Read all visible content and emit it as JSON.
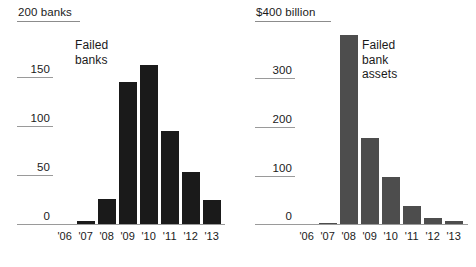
{
  "chart_data": [
    {
      "id": "failed-banks",
      "type": "bar",
      "title": "Failed banks",
      "axis_caption": "200 banks",
      "xlabel": "",
      "ylabel": "banks",
      "ylim": [
        0,
        200
      ],
      "grid": true,
      "legend": "none",
      "categories": [
        "'06",
        "'07",
        "'08",
        "'09",
        "'10",
        "'11",
        "'12",
        "'13"
      ],
      "values": [
        0,
        3,
        25,
        140,
        157,
        92,
        51,
        24
      ],
      "yticks": [
        0,
        50,
        100,
        150
      ],
      "ytick_labels": [
        "0",
        "50",
        "100",
        "150"
      ],
      "bar_color": "#1a1a1a"
    },
    {
      "id": "failed-bank-assets",
      "type": "bar",
      "title": "Failed bank assets",
      "axis_caption": "$400 billion",
      "xlabel": "",
      "ylabel": "billion dollars",
      "ylim": [
        0,
        400
      ],
      "grid": true,
      "legend": "none",
      "categories": [
        "'06",
        "'07",
        "'08",
        "'09",
        "'10",
        "'11",
        "'12",
        "'13"
      ],
      "values": [
        0,
        2,
        372,
        170,
        92,
        35,
        12,
        6
      ],
      "yticks": [
        0,
        100,
        200,
        300
      ],
      "ytick_labels": [
        "0",
        "100",
        "200",
        "300"
      ],
      "bar_color": "#4d4d4d"
    }
  ],
  "left": {
    "axis_caption": "200 banks",
    "series_note": "Failed\nbanks",
    "ticks": [
      "150",
      "100",
      "50",
      "0"
    ],
    "xlabels": [
      "'06",
      "'07",
      "'08",
      "'09",
      "'10",
      "'11",
      "'12",
      "'13"
    ]
  },
  "right": {
    "axis_caption": "$400 billion",
    "series_note": "Failed\nbank\nassets",
    "ticks": [
      "300",
      "200",
      "100",
      "0"
    ],
    "xlabels": [
      "'06",
      "'07",
      "'08",
      "'09",
      "'10",
      "'11",
      "'12",
      "'13"
    ]
  }
}
